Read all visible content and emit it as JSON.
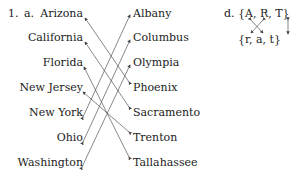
{
  "problem": {
    "number": "1.",
    "part_a": {
      "label": "a.",
      "states": [
        "Arizona",
        "California",
        "Florida",
        "New Jersey",
        "New York",
        "Ohio",
        "Washington"
      ],
      "capitals": [
        "Albany",
        "Columbus",
        "Olympia",
        "Phoenix",
        "Sacramento",
        "Trenton",
        "Tallahassee"
      ],
      "matches": [
        {
          "state": "Arizona",
          "capital": "Phoenix"
        },
        {
          "state": "California",
          "capital": "Sacramento"
        },
        {
          "state": "Florida",
          "capital": "Tallahassee"
        },
        {
          "state": "New Jersey",
          "capital": "Trenton"
        },
        {
          "state": "New York",
          "capital": "Albany"
        },
        {
          "state": "Ohio",
          "capital": "Columbus"
        },
        {
          "state": "Washington",
          "capital": "Olympia"
        }
      ]
    },
    "part_d": {
      "label": "d.",
      "top_set": [
        "A",
        "R",
        "T"
      ],
      "bottom_set": [
        "r",
        "a",
        "t"
      ],
      "top_text": "{A,  R,   T}",
      "bottom_text": "{r,   a,    t}"
    }
  }
}
